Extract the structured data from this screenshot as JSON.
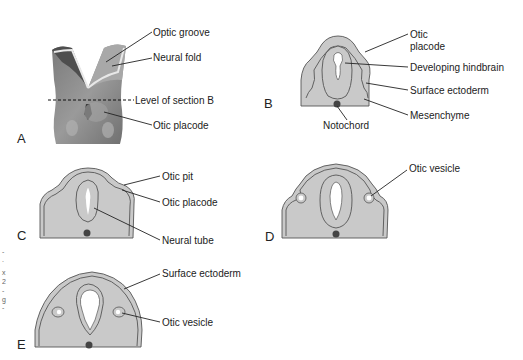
{
  "panels": {
    "A": {
      "letter": "A",
      "labels": {
        "optic_groove": "Optic groove",
        "neural_fold": "Neural fold",
        "level_of_section": "Level of section B",
        "otic_placode": "Otic placode"
      }
    },
    "B": {
      "letter": "B",
      "labels": {
        "otic_placode_line1": "Otic",
        "otic_placode_line2": "placode",
        "developing_hindbrain": "Developing hindbrain",
        "surface_ectoderm": "Surface ectoderm",
        "mesenchyme": "Mesenchyme",
        "notochord": "Notochord"
      }
    },
    "C": {
      "letter": "C",
      "labels": {
        "otic_pit": "Otic pit",
        "otic_placode": "Otic placode",
        "neural_tube": "Neural tube"
      }
    },
    "D": {
      "letter": "D",
      "labels": {
        "otic_vesicle": "Otic vesicle"
      }
    },
    "E": {
      "letter": "E",
      "labels": {
        "surface_ectoderm": "Surface ectoderm",
        "otic_vesicle": "Otic vesicle"
      }
    }
  },
  "margin_fragments": [
    "-",
    ".",
    "x",
    "2",
    "-",
    "g",
    "-"
  ],
  "colors": {
    "tissue_fill": "#c9c9c9",
    "outline": "#555555",
    "notochord": "#444444",
    "text": "#222222"
  }
}
